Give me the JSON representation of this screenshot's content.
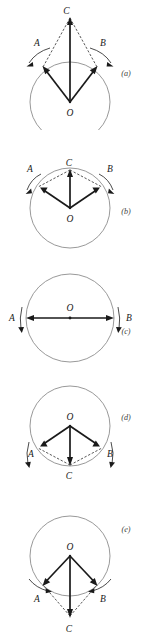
{
  "figure": {
    "background_color": "#ffffff",
    "stroke_color": "#1a1a1a",
    "circle_color": "#8d8d8d",
    "dashed_color": "#3a3a3a",
    "panel_count": 5
  },
  "panels": [
    {
      "id": "(a)",
      "center_label": "O",
      "left_label": "A",
      "right_label": "B",
      "resultant_label": "C",
      "resultant_direction": "up",
      "resultant_tip_outside": true,
      "description": "Vectors A and B drawn from center O to points on the upper circle; resultant C points upward beyond the circle."
    },
    {
      "id": "(b)",
      "center_label": "O",
      "left_label": "A",
      "right_label": "B",
      "resultant_label": "C",
      "resultant_direction": "up",
      "resultant_tip_outside": false,
      "description": "Vectors A and B from center O to points near the top of the circle; resultant C points upward ending on the circle."
    },
    {
      "id": "(c)",
      "center_label": "O",
      "left_label": "A",
      "right_label": "B",
      "resultant_label": "",
      "resultant_direction": "none",
      "resultant_tip_outside": false,
      "description": "Opposed vectors A and B along the horizontal diameter through O; they cancel, no resultant."
    },
    {
      "id": "(d)",
      "center_label": "O",
      "left_label": "A",
      "right_label": "B",
      "resultant_label": "C",
      "resultant_direction": "down",
      "resultant_tip_outside": false,
      "description": "Vectors A and B from center O to points near the bottom of the circle; resultant C points downward ending on the circle."
    },
    {
      "id": "(e)",
      "center_label": "O",
      "left_label": "A",
      "right_label": "B",
      "resultant_label": "C",
      "resultant_direction": "down",
      "resultant_tip_outside": true,
      "description": "Vectors A and B from center O to points on the lower circle; resultant C points downward beyond the circle."
    }
  ]
}
